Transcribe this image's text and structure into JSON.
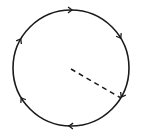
{
  "diagram": {
    "type": "circle-with-radius",
    "colors": {
      "background": "#ffffff",
      "stroke": "#1a1a1a"
    },
    "circle": {
      "cx": 71,
      "cy": 68,
      "r": 58,
      "stroke_width": 1.6
    },
    "radius_line": {
      "style": "dashed",
      "x1": 71,
      "y1": 69,
      "x2": 121,
      "y2": 98,
      "dash": "5,4"
    },
    "direction": "clockwise",
    "arrow_markers": [
      {
        "label": "top",
        "angle_deg": -89
      },
      {
        "label": "upper-right",
        "angle_deg": -31
      },
      {
        "label": "lower-right",
        "angle_deg": 30
      },
      {
        "label": "bottom",
        "angle_deg": 92
      },
      {
        "label": "lower-left",
        "angle_deg": 149
      },
      {
        "label": "upper-left",
        "angle_deg": 210
      }
    ]
  }
}
